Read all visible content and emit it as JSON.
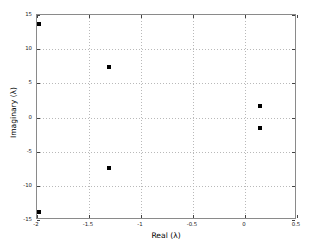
{
  "chart_data": {
    "type": "scatter",
    "title": "",
    "xlabel": "Real (λ)",
    "ylabel": "Imaginary (λ)",
    "xlim": [
      -2,
      0.5
    ],
    "ylim": [
      -15,
      15
    ],
    "grid": true,
    "legend": null,
    "marker": {
      "shape": "square",
      "color": "#000000",
      "size_px": 4
    },
    "xticks": [
      -2,
      -1.5,
      -1,
      -0.5,
      0,
      0.5
    ],
    "xticklabels": [
      "-2",
      "-1.5",
      "-1",
      "-0.5",
      "0",
      "0.5"
    ],
    "yticks": [
      -15,
      -10,
      -5,
      0,
      5,
      10,
      15
    ],
    "yticklabels": [
      "-15",
      "-10",
      "-5",
      "0",
      "5",
      "10",
      "15"
    ],
    "series": [
      {
        "name": "eigenvalues",
        "points": [
          {
            "x": -1.98,
            "y": 13.7
          },
          {
            "x": -1.31,
            "y": 7.4
          },
          {
            "x": 0.14,
            "y": 1.7
          },
          {
            "x": 0.14,
            "y": -1.6
          },
          {
            "x": -1.31,
            "y": -7.4
          },
          {
            "x": -1.98,
            "y": -13.9
          }
        ]
      }
    ]
  },
  "axes": {
    "background_color": "#ffffff",
    "frame_color": "#8a8a8a",
    "grid_color": "#b9b9b9"
  }
}
